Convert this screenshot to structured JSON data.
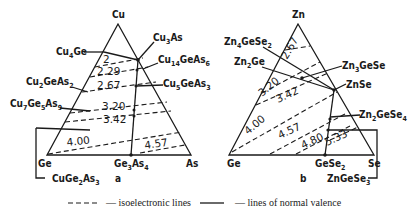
{
  "diagram_a": {
    "panel_label": "a",
    "vertices": {
      "top": "Cu",
      "left": "Ge",
      "right": "As"
    },
    "compounds": {
      "cu4ge": "Cu4Ge",
      "cu3as": "Cu3As",
      "cu14geas6": "Cu14GeAs6",
      "cu2geas2": "Cu2GeAs2",
      "cu5geas3": "Cu5GeAs3",
      "cu7ge5as9": "Cu7Ge5As9",
      "ge3as4": "Ge3As4",
      "cuge2as3": "CuGe2As3"
    },
    "isoelectronic_values": [
      "2",
      "2.29",
      "2.67",
      "3.20",
      "3.42",
      "4.00",
      "4.57"
    ]
  },
  "diagram_b": {
    "panel_label": "b",
    "vertices": {
      "top": "Zn",
      "left": "Ge",
      "right": "Se"
    },
    "compounds": {
      "zn4gese2": "Zn4GeSe2",
      "zn2ge": "Zn2Ge",
      "zn3gese": "Zn3GeSe",
      "znse": "ZnSe",
      "zn2gese4": "Zn2GeSe4",
      "gese2": "GeSe2",
      "zngese3": "ZnGeSe3"
    },
    "isoelectronic_values": [
      "2.67",
      "3.20",
      "3.42",
      "4.00",
      "4.57",
      "4.80",
      "5.33"
    ]
  },
  "legend": {
    "isoelectronic": "— isoelectronic lines",
    "normal_valence": "— lines of normal valence"
  }
}
